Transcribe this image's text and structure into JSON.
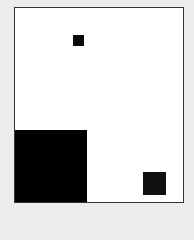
{
  "canvas": {
    "background": "#ececec",
    "panel": {
      "background": "#ffffff",
      "border": "#333333"
    },
    "shapes": [
      {
        "name": "small-square-top",
        "color": "#0a0a0a",
        "x": 73,
        "y": 35,
        "w": 11,
        "h": 11
      },
      {
        "name": "large-block-bottom-left",
        "color": "#000000",
        "x": 15,
        "y": 130,
        "w": 72,
        "h": 72
      },
      {
        "name": "small-square-bottom-right",
        "color": "#111111",
        "x": 143,
        "y": 172,
        "w": 23,
        "h": 23
      }
    ]
  }
}
